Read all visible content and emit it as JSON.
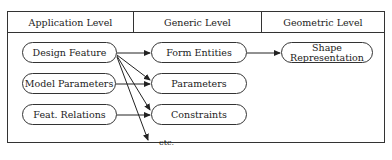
{
  "diagram": {
    "headers": [
      "Application Level",
      "Generic Level",
      "Geometric Level"
    ],
    "application_nodes": [
      "Design Feature",
      "Model Parameters",
      "Feat. Relations"
    ],
    "generic_nodes": [
      "Form Entities",
      "Parameters",
      "Constraints"
    ],
    "geometric_nodes": [
      "Shape Representation"
    ],
    "etc_label": "etc.",
    "edges": [
      {
        "from": "Design Feature",
        "to": "Form Entities"
      },
      {
        "from": "Design Feature",
        "to": "Parameters"
      },
      {
        "from": "Design Feature",
        "to": "Constraints"
      },
      {
        "from": "Design Feature",
        "to": "etc."
      },
      {
        "from": "Model Parameters",
        "to": "Parameters"
      },
      {
        "from": "Feat. Relations",
        "to": "Constraints"
      },
      {
        "from": "Form Entities",
        "to": "Shape Representation"
      }
    ]
  }
}
